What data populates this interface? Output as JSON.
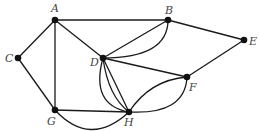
{
  "diagram": {
    "type": "undirected multigraph",
    "colors": {
      "edge": "#1a1a1a",
      "node": "#111111",
      "label": "#444444",
      "background": "#ffffff"
    },
    "nodes": [
      {
        "id": "A",
        "label": "A",
        "x": 55,
        "y": 20,
        "lx": 51,
        "ly": 12
      },
      {
        "id": "B",
        "label": "B",
        "x": 168,
        "y": 20,
        "lx": 165,
        "ly": 14
      },
      {
        "id": "C",
        "label": "C",
        "x": 18,
        "y": 58,
        "lx": 5,
        "ly": 62
      },
      {
        "id": "D",
        "label": "D",
        "x": 103,
        "y": 58,
        "lx": 90,
        "ly": 66
      },
      {
        "id": "E",
        "label": "E",
        "x": 244,
        "y": 40,
        "lx": 249,
        "ly": 45
      },
      {
        "id": "F",
        "label": "F",
        "x": 187,
        "y": 77,
        "lx": 189,
        "ly": 91
      },
      {
        "id": "G",
        "label": "G",
        "x": 55,
        "y": 110,
        "lx": 47,
        "ly": 125
      },
      {
        "id": "H",
        "label": "H",
        "x": 129,
        "y": 112,
        "lx": 124,
        "ly": 126
      }
    ],
    "edges": [
      {
        "id": "A-B",
        "from": "A",
        "to": "B",
        "d": "M55,20 L168,20"
      },
      {
        "id": "A-C",
        "from": "A",
        "to": "C",
        "d": "M55,20 L18,58"
      },
      {
        "id": "A-G",
        "from": "A",
        "to": "G",
        "d": "M55,20 L55,110"
      },
      {
        "id": "A-D",
        "from": "A",
        "to": "D",
        "d": "M55,20 L103,58"
      },
      {
        "id": "C-G",
        "from": "C",
        "to": "G",
        "d": "M18,58 L55,110"
      },
      {
        "id": "G-H",
        "from": "G",
        "to": "H",
        "d": "M55,110 L129,112"
      },
      {
        "id": "G-H-2",
        "from": "G",
        "to": "H",
        "d": "M55,110 Q90,148 129,112"
      },
      {
        "id": "B-D",
        "from": "B",
        "to": "D",
        "d": "M168,20 L103,58"
      },
      {
        "id": "B-D-2",
        "from": "B",
        "to": "D",
        "d": "M168,20 Q168,58 103,58"
      },
      {
        "id": "B-E",
        "from": "B",
        "to": "E",
        "d": "M168,20 L244,40"
      },
      {
        "id": "D-F",
        "from": "D",
        "to": "F",
        "d": "M103,58 L187,77"
      },
      {
        "id": "E-F",
        "from": "E",
        "to": "F",
        "d": "M244,40 L187,77"
      },
      {
        "id": "D-H",
        "from": "D",
        "to": "H",
        "d": "M103,58 L129,112"
      },
      {
        "id": "D-H-2",
        "from": "D",
        "to": "H",
        "d": "M103,58 Q108,96 129,112"
      },
      {
        "id": "D-H-3",
        "from": "D",
        "to": "H",
        "d": "M103,58 Q90,105 129,112"
      },
      {
        "id": "H-F",
        "from": "H",
        "to": "F",
        "d": "M129,112 Q150,80 187,77"
      },
      {
        "id": "H-F-2",
        "from": "H",
        "to": "F",
        "d": "M129,112 Q185,115 187,77"
      }
    ]
  }
}
